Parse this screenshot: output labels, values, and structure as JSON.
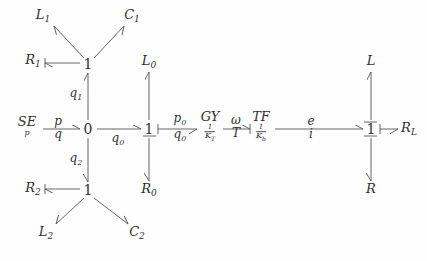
{
  "diagram": {
    "background": "#fefefe",
    "stroke": "#555555",
    "text_color": "#303030"
  },
  "junctions": [
    {
      "id": "j-top-1",
      "label": "1",
      "x": 88,
      "y": 64
    },
    {
      "id": "j-zero",
      "label": "0",
      "x": 88,
      "y": 129
    },
    {
      "id": "j-bottom-1",
      "label": "1",
      "x": 88,
      "y": 190
    },
    {
      "id": "j-mid-1",
      "label": "1",
      "x": 149,
      "y": 129
    },
    {
      "id": "j-right-1",
      "label": "1",
      "x": 371,
      "y": 129
    }
  ],
  "elements": [
    {
      "id": "elem-se",
      "main": "SE",
      "sub": "p",
      "x": 27,
      "y": 126
    },
    {
      "id": "elem-gy",
      "main": "GY",
      "sub": "1/K_T",
      "sub_num": "1",
      "sub_den": "K",
      "sub_den_sub": "T",
      "x": 210,
      "y": 126
    },
    {
      "id": "elem-tf",
      "main": "TF",
      "sub": "1/K_b",
      "sub_num": "1",
      "sub_den": "K",
      "sub_den_sub": "b",
      "x": 261,
      "y": 126
    }
  ],
  "ports": [
    {
      "id": "port-l1",
      "label": "L",
      "subscript": "1",
      "x": 43,
      "y": 16
    },
    {
      "id": "port-c1",
      "label": "C",
      "subscript": "1",
      "x": 132,
      "y": 16
    },
    {
      "id": "port-r1",
      "label": "R",
      "subscript": "1",
      "x": 33,
      "y": 61
    },
    {
      "id": "port-l2",
      "label": "L",
      "subscript": "2",
      "x": 46,
      "y": 233
    },
    {
      "id": "port-c2",
      "label": "C",
      "subscript": "2",
      "x": 137,
      "y": 233
    },
    {
      "id": "port-r2",
      "label": "R",
      "subscript": "2",
      "x": 33,
      "y": 189
    },
    {
      "id": "port-l0",
      "label": "L",
      "subscript": "0",
      "x": 149,
      "y": 62
    },
    {
      "id": "port-r0",
      "label": "R",
      "subscript": "0",
      "x": 149,
      "y": 190
    },
    {
      "id": "port-l",
      "label": "L",
      "subscript": "",
      "x": 371,
      "y": 62
    },
    {
      "id": "port-r",
      "label": "R",
      "subscript": "",
      "x": 371,
      "y": 190
    },
    {
      "id": "port-rl",
      "label": "R",
      "subscript": "L",
      "x": 409,
      "y": 129
    }
  ],
  "bond_labels": [
    {
      "id": "bond-se-zero",
      "num": "p",
      "den": "q",
      "x": 58,
      "y": 128
    },
    {
      "id": "bond-q1",
      "num": "q",
      "num_sub": "1",
      "den": "",
      "x": 76,
      "y": 95
    },
    {
      "id": "bond-q2",
      "num": "q",
      "num_sub": "2",
      "den": "",
      "x": 76,
      "y": 160
    },
    {
      "id": "bond-zero-mid",
      "num": "",
      "den": "q",
      "den_sub": "0",
      "x": 118,
      "y": 140
    },
    {
      "id": "bond-mid-gy",
      "num": "p",
      "num_sub": "0",
      "den": "q",
      "den_sub": "0",
      "x": 180,
      "y": 128
    },
    {
      "id": "bond-gy-tf",
      "num": "ω",
      "den": "T",
      "x": 236,
      "y": 127
    },
    {
      "id": "bond-tf-right",
      "num": "e",
      "den": "i",
      "x": 311,
      "y": 128
    }
  ],
  "bonds": [
    {
      "id": "bond-se-to-zero",
      "from": "SE",
      "to": "0"
    },
    {
      "id": "bond-zero-to-top1",
      "from": "0",
      "to": "1-top"
    },
    {
      "id": "bond-zero-to-bottom1",
      "from": "0",
      "to": "1-bottom"
    },
    {
      "id": "bond-zero-to-mid1",
      "from": "0",
      "to": "1-mid"
    },
    {
      "id": "bond-mid1-to-gy",
      "from": "1-mid",
      "to": "GY"
    },
    {
      "id": "bond-gy-to-tf",
      "from": "GY",
      "to": "TF"
    },
    {
      "id": "bond-tf-to-right1",
      "from": "TF",
      "to": "1-right"
    },
    {
      "id": "bond-right1-to-rl",
      "from": "1-right",
      "to": "RL"
    },
    {
      "id": "bond-top1-to-l1",
      "from": "1-top",
      "to": "L1"
    },
    {
      "id": "bond-top1-to-c1",
      "from": "1-top",
      "to": "C1"
    },
    {
      "id": "bond-top1-to-r1",
      "from": "1-top",
      "to": "R1"
    },
    {
      "id": "bond-bottom1-to-l2",
      "from": "1-bottom",
      "to": "L2"
    },
    {
      "id": "bond-bottom1-to-c2",
      "from": "1-bottom",
      "to": "C2"
    },
    {
      "id": "bond-bottom1-to-r2",
      "from": "1-bottom",
      "to": "R2"
    },
    {
      "id": "bond-mid1-to-l0",
      "from": "1-mid",
      "to": "L0"
    },
    {
      "id": "bond-mid1-to-r0",
      "from": "1-mid",
      "to": "R0"
    },
    {
      "id": "bond-right1-to-l",
      "from": "1-right",
      "to": "L"
    },
    {
      "id": "bond-right1-to-r",
      "from": "1-right",
      "to": "R"
    }
  ]
}
